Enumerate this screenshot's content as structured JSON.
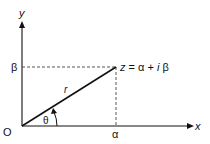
{
  "diagram": {
    "axes": {
      "x_label": "x",
      "y_label": "y",
      "origin_label": "O"
    },
    "point": {
      "label": "z = α + i β",
      "label_parts": [
        "z",
        " = α + ",
        "i",
        " β"
      ]
    },
    "projections": {
      "x_value_label": "α",
      "y_value_label": "β"
    },
    "radius_label": "r",
    "angle_label": "θ",
    "colors": {
      "line": "#111111",
      "dashed": "#444444",
      "background": "#ffffff"
    }
  }
}
